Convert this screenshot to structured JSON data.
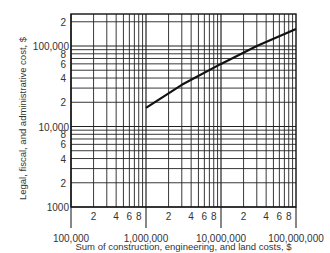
{
  "chart_data": {
    "type": "line",
    "title": "",
    "xlabel": "Sum of construction, engineering, and land costs, $",
    "ylabel": "Legal, fiscal, and administrative cost, $",
    "xscale": "log",
    "yscale": "log",
    "xlim": [
      100000,
      100000000
    ],
    "ylim": [
      1000,
      240000
    ],
    "x_major_ticks": [
      "100,000",
      "1,000,000",
      "10,000,000",
      "100,000,000"
    ],
    "x_minor_tick_labels": [
      "2",
      "4",
      "6",
      "8"
    ],
    "y_major_ticks": [
      "1000",
      "10,000",
      "100,000"
    ],
    "y_minor_tick_labels": [
      "2",
      "4",
      "6",
      "8"
    ],
    "grid": true,
    "series": [
      {
        "name": "Legal, fiscal, and administrative cost",
        "x": [
          1000000,
          3000000,
          10000000,
          30000000,
          100000000
        ],
        "y": [
          17000,
          33000,
          60000,
          100000,
          162000
        ]
      }
    ]
  }
}
